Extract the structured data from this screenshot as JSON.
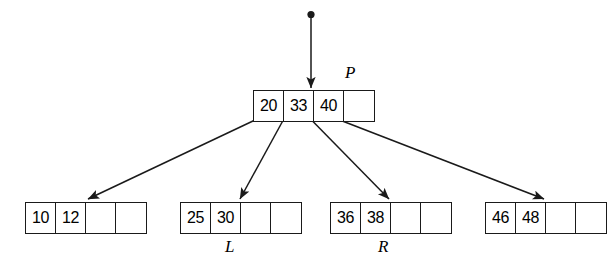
{
  "diagram": {
    "type": "b-tree-node-split",
    "title": "",
    "nodes": {
      "root": {
        "label": "P",
        "cells": [
          {
            "value": "20",
            "empty": false
          },
          {
            "value": "33",
            "empty": false
          },
          {
            "value": "40",
            "empty": false
          },
          {
            "value": "",
            "empty": true
          }
        ]
      },
      "leaf1": {
        "label": "",
        "cells": [
          {
            "value": "10",
            "empty": false
          },
          {
            "value": "12",
            "empty": false
          },
          {
            "value": "",
            "empty": true
          },
          {
            "value": "",
            "empty": true
          }
        ]
      },
      "leaf2": {
        "label": "L",
        "cells": [
          {
            "value": "25",
            "empty": false
          },
          {
            "value": "30",
            "empty": false
          },
          {
            "value": "",
            "empty": true
          },
          {
            "value": "",
            "empty": true
          }
        ]
      },
      "leaf3": {
        "label": "R",
        "cells": [
          {
            "value": "36",
            "empty": false
          },
          {
            "value": "38",
            "empty": false
          },
          {
            "value": "",
            "empty": true
          },
          {
            "value": "",
            "empty": true
          }
        ]
      },
      "leaf4": {
        "label": "",
        "cells": [
          {
            "value": "46",
            "empty": false
          },
          {
            "value": "48",
            "empty": false
          },
          {
            "value": "",
            "empty": true
          },
          {
            "value": "",
            "empty": true
          }
        ]
      }
    },
    "colors": {
      "stroke": "#1a1a1a",
      "background": "#ffffff",
      "text": "#000000"
    }
  }
}
